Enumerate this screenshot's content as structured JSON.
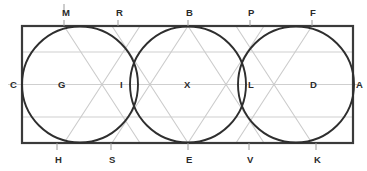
{
  "figure": {
    "type": "geometry-diagram",
    "canvas": {
      "width": 367,
      "height": 171,
      "background": "#ffffff"
    },
    "colors": {
      "outline": "#3a3a3a",
      "circle_stroke": "#2e2e2e",
      "guide_line": "#c9c9c9",
      "diagonal_line": "#cccccc",
      "tick": "#9a9a9a",
      "label_text": "#2b2b2b"
    },
    "rectangle": {
      "name": "bounding-rectangle",
      "x": 22,
      "y": 26,
      "width": 331,
      "height": 117,
      "stroke_width": 2.2
    },
    "circles": [
      {
        "name": "circle-left",
        "center_label": "G",
        "cx": 80,
        "cy": 84.5,
        "r": 58,
        "stroke_width": 1.9
      },
      {
        "name": "circle-middle",
        "center_label": "X",
        "cx": 188,
        "cy": 84.5,
        "r": 58,
        "stroke_width": 1.9
      },
      {
        "name": "circle-right",
        "center_label": "D",
        "cx": 296,
        "cy": 84.5,
        "r": 58,
        "stroke_width": 1.9
      }
    ],
    "guide_lines_horizontal": [
      {
        "name": "guide-upper",
        "y": 52,
        "x1": 22,
        "x2": 353
      },
      {
        "name": "guide-middle",
        "y": 84.5,
        "x1": 8,
        "x2": 360
      },
      {
        "name": "guide-lower",
        "y": 117,
        "x1": 22,
        "x2": 353
      }
    ],
    "diagonals": [
      {
        "name": "diagonal-b-to-lower-left",
        "x1": 188,
        "y1": 26,
        "x2": 112,
        "y2": 143
      },
      {
        "name": "diagonal-b-to-lower-right",
        "x1": 188,
        "y1": 26,
        "x2": 264,
        "y2": 143
      },
      {
        "name": "diagonal-e-to-upper-left",
        "x1": 188,
        "y1": 143,
        "x2": 112,
        "y2": 26
      },
      {
        "name": "diagonal-e-to-upper-right",
        "x1": 188,
        "y1": 143,
        "x2": 264,
        "y2": 26
      },
      {
        "name": "diagonal-m-to-lower-right",
        "x1": 64,
        "y1": 26,
        "x2": 140,
        "y2": 143
      },
      {
        "name": "diagonal-h-to-upper-right",
        "x1": 64,
        "y1": 143,
        "x2": 140,
        "y2": 26
      },
      {
        "name": "diagonal-f-to-lower-left",
        "x1": 312,
        "y1": 26,
        "x2": 236,
        "y2": 143
      },
      {
        "name": "diagonal-k-to-upper-left",
        "x1": 312,
        "y1": 143,
        "x2": 236,
        "y2": 26
      }
    ],
    "ticks": [
      {
        "name": "tick-above-m",
        "x": 64,
        "y1": 4,
        "y2": 12
      },
      {
        "name": "tick-top-m",
        "x": 64,
        "y1": 20,
        "y2": 26
      },
      {
        "name": "tick-top-r",
        "x": 118,
        "y1": 20,
        "y2": 26
      },
      {
        "name": "tick-top-b",
        "x": 188,
        "y1": 20,
        "y2": 26
      },
      {
        "name": "tick-top-p",
        "x": 250,
        "y1": 20,
        "y2": 26
      },
      {
        "name": "tick-top-f",
        "x": 312,
        "y1": 20,
        "y2": 26
      },
      {
        "name": "tick-bottom-h",
        "x": 57,
        "y1": 143,
        "y2": 150
      },
      {
        "name": "tick-bottom-s",
        "x": 111,
        "y1": 143,
        "y2": 150
      },
      {
        "name": "tick-bottom-e",
        "x": 188,
        "y1": 143,
        "y2": 150
      },
      {
        "name": "tick-bottom-v",
        "x": 249,
        "y1": 143,
        "y2": 150
      },
      {
        "name": "tick-bottom-k",
        "x": 316,
        "y1": 143,
        "y2": 150
      }
    ],
    "labels_top": [
      {
        "id": "label-m",
        "text": "M",
        "x": 62,
        "y": 16
      },
      {
        "id": "label-r",
        "text": "R",
        "x": 116,
        "y": 16
      },
      {
        "id": "label-b",
        "text": "B",
        "x": 186,
        "y": 16
      },
      {
        "id": "label-p",
        "text": "P",
        "x": 248,
        "y": 16
      },
      {
        "id": "label-f",
        "text": "F",
        "x": 310,
        "y": 16
      }
    ],
    "labels_bottom": [
      {
        "id": "label-h",
        "text": "H",
        "x": 55,
        "y": 163
      },
      {
        "id": "label-s",
        "text": "S",
        "x": 109,
        "y": 163
      },
      {
        "id": "label-e",
        "text": "E",
        "x": 186,
        "y": 163
      },
      {
        "id": "label-v",
        "text": "V",
        "x": 247,
        "y": 163
      },
      {
        "id": "label-k",
        "text": "K",
        "x": 314,
        "y": 163
      }
    ],
    "labels_middle": [
      {
        "id": "label-c",
        "text": "C",
        "x": 10,
        "y": 88
      },
      {
        "id": "label-g",
        "text": "G",
        "x": 58,
        "y": 88
      },
      {
        "id": "label-i",
        "text": "I",
        "x": 120,
        "y": 88
      },
      {
        "id": "label-x",
        "text": "X",
        "x": 184,
        "y": 88
      },
      {
        "id": "label-l",
        "text": "L",
        "x": 248,
        "y": 88
      },
      {
        "id": "label-d",
        "text": "D",
        "x": 310,
        "y": 88
      },
      {
        "id": "label-a",
        "text": "A",
        "x": 356,
        "y": 88
      }
    ]
  }
}
